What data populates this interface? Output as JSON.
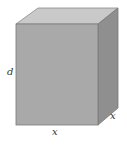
{
  "diagram": {
    "type": "rectangular-box",
    "labels": {
      "height": "d",
      "width": "x",
      "depth": "x"
    },
    "colors": {
      "front_face": "#a9a9a9",
      "top_face": "#c9c9c9",
      "side_face": "#8f8f8f",
      "edge": "#7a7a7a"
    }
  }
}
